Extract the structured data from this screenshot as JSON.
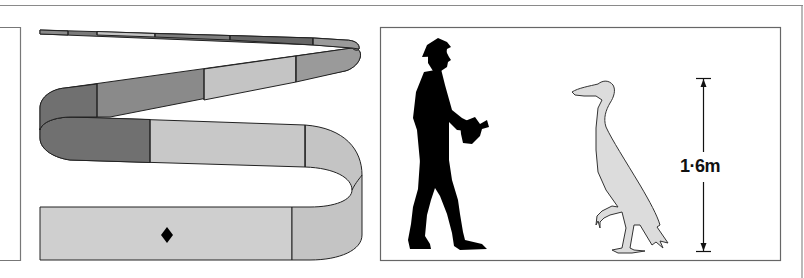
{
  "figure": {
    "left_panel": {
      "name": "ribbon-scale-diagram",
      "segment_colors": {
        "dark": "#6e6e6e",
        "mid": "#8c8c8c",
        "light": "#c8c8c8",
        "lighter": "#d2d2d2"
      },
      "marker": "diamond"
    },
    "right_panel": {
      "name": "size-comparison",
      "figures": [
        "man-silhouette",
        "bird-silhouette"
      ],
      "bird_fill": "#dcdcdc",
      "height_label": "1·6m"
    },
    "frame_color": "#777777"
  }
}
